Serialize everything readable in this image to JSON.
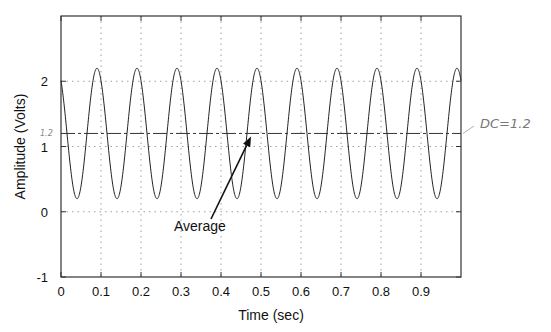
{
  "chart_data": {
    "type": "line",
    "title": "",
    "xlabel": "Time (sec)",
    "ylabel": "Amplitude (Volts)",
    "xlim": [
      0,
      1
    ],
    "ylim": [
      -1,
      3
    ],
    "xticks": [
      0,
      0.1,
      0.2,
      0.3,
      0.4,
      0.5,
      0.6,
      0.7,
      0.8,
      0.9
    ],
    "xtick_labels": [
      "0",
      "0.1",
      "0.2",
      "0.3",
      "0.4",
      "0.5",
      "0.6",
      "0.7",
      "0.8",
      "0.9"
    ],
    "yticks": [
      -1,
      0,
      1,
      2
    ],
    "ytick_labels": [
      "-1",
      "0",
      "1",
      "2"
    ],
    "grid": true,
    "series": [
      {
        "name": "signal",
        "description": "Sinusoid, DC offset 1.2 V, amplitude 1 V, frequency 10 Hz",
        "dc_offset": 1.2,
        "amplitude": 1.0,
        "frequency_hz": 10,
        "peak_time_first": 0.09,
        "max": 2.2,
        "min": 0.2,
        "style": "solid"
      },
      {
        "name": "average",
        "value": 1.2,
        "style": "dash-dot"
      }
    ],
    "annotations": [
      {
        "text": "Average",
        "x": 0.23,
        "y": 0.05,
        "arrow_to": {
          "x": 0.48,
          "y": 1.2
        }
      },
      {
        "text": "DC=1.2",
        "handwritten": true,
        "position": "right of plot at y=1.2"
      },
      {
        "text": "1.2",
        "handwritten": true,
        "position": "left y-axis at y=1.2"
      }
    ]
  }
}
